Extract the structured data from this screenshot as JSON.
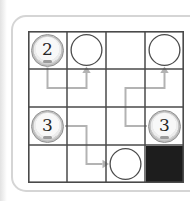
{
  "page": {
    "background": "#ffffff"
  },
  "puzzle": {
    "card": {
      "border_color": "#d5d5d5",
      "background": "#ffffff",
      "corner_radius": 15
    },
    "board": {
      "rows": 4,
      "cols": 4,
      "line_color": "#4a4a4a",
      "arrow_color": "#b3b3b3",
      "blocked_color": "#1d1d1d",
      "target_outline": "#4c4c4c",
      "token_ring_color": "#8f8f8f",
      "tokens": [
        {
          "label": "2",
          "row": 0,
          "col": 0
        },
        {
          "label": "3",
          "row": 2,
          "col": 0
        },
        {
          "label": "3",
          "row": 2,
          "col": 3
        }
      ],
      "targets": [
        {
          "row": 0,
          "col": 1
        },
        {
          "row": 0,
          "col": 3
        },
        {
          "row": 3,
          "col": 2
        }
      ],
      "blocked": [
        {
          "row": 3,
          "col": 3
        }
      ],
      "arrows": [
        {
          "path": [
            [
              0,
              0
            ],
            [
              0,
              1
            ],
            [
              1,
              1
            ],
            [
              1,
              0
            ]
          ]
        },
        {
          "path": [
            [
              3,
              2
            ],
            [
              2,
              2
            ],
            [
              2,
              1
            ],
            [
              3,
              1
            ],
            [
              3,
              0
            ]
          ]
        },
        {
          "path": [
            [
              0,
              2
            ],
            [
              1,
              2
            ],
            [
              1,
              3
            ],
            [
              2,
              3
            ]
          ]
        }
      ]
    }
  }
}
